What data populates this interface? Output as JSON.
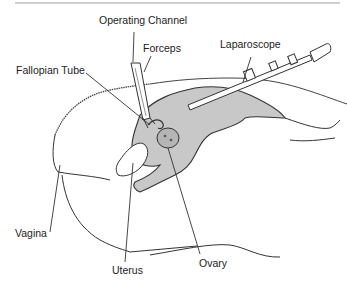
{
  "diagram": {
    "type": "anatomical illustration",
    "colors": {
      "line": "#333333",
      "organ_fill": "#c8c8c8",
      "background": "#ffffff"
    },
    "labels": {
      "operating_channel": "Operating Channel",
      "forceps": "Forceps",
      "laparoscope": "Laparoscope",
      "fallopian_tube": "Fallopian Tube",
      "vagina": "Vagina",
      "uterus": "Uterus",
      "ovary": "Ovary"
    }
  }
}
